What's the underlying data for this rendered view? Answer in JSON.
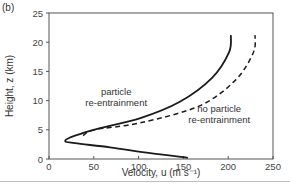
{
  "panel_label": "(b)",
  "chart_data": {
    "type": "line",
    "title": "",
    "xlabel": "Velocity, u (m s⁻¹)",
    "ylabel": "Height, z (km)",
    "xlim": [
      0,
      250
    ],
    "ylim": [
      0,
      25
    ],
    "xticks": [
      0,
      50,
      100,
      150,
      200,
      250
    ],
    "yticks": [
      0,
      5,
      10,
      15,
      20,
      25
    ],
    "grid": false,
    "legend": "none (inline annotations)",
    "series": [
      {
        "name": "particle re-entrainment",
        "style": "solid",
        "x": [
          155,
          113,
          68,
          29,
          18,
          29,
          57,
          102,
          146,
          182,
          201,
          203
        ],
        "y": [
          0.2,
          1,
          2,
          2.7,
          3.1,
          4,
          5.3,
          7,
          9.8,
          13.9,
          18.3,
          21.2
        ]
      },
      {
        "name": "no particle re-entrainment",
        "style": "dashed",
        "x": [
          38,
          51,
          102,
          168,
          208,
          228,
          230
        ],
        "y": [
          4,
          5,
          6.2,
          9.1,
          13.5,
          18.2,
          21.2
        ]
      }
    ],
    "annotations": [
      {
        "text": [
          "particle",
          "re-entrainment"
        ],
        "u": 75,
        "z": 11
      },
      {
        "text": [
          "no particle",
          "re-entrainment"
        ],
        "u": 190,
        "z": 8
      }
    ]
  }
}
